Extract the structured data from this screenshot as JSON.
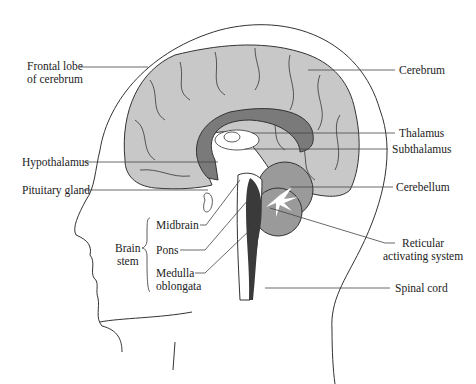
{
  "colors": {
    "cortex": "#c8c8c8",
    "corpus_callosum": "#7a7a7a",
    "cerebellum": "#9a9a9a",
    "reticular": "#3a3a3a",
    "outline": "#333333",
    "leader": "#444444"
  },
  "labels": {
    "frontal_lobe_1": "Frontal lobe",
    "frontal_lobe_2": "of cerebrum",
    "cerebrum": "Cerebrum",
    "thalamus": "Thalamus",
    "subthalamus": "Subthalamus",
    "hypothalamus": "Hypothalamus",
    "pituitary": "Pituitary gland",
    "cerebellum": "Cerebellum",
    "midbrain": "Midbrain",
    "pons": "Pons",
    "medulla_1": "Medulla",
    "medulla_2": "oblongata",
    "brain_stem_1": "Brain",
    "brain_stem_2": "stem",
    "reticular_1": "Reticular",
    "reticular_2": "activating system",
    "spinal_cord": "Spinal cord"
  }
}
